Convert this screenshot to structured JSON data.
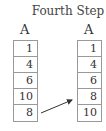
{
  "title": "Fourth Step",
  "left": {
    "label": "A",
    "values": [
      "1",
      "4",
      "6",
      "10",
      "8"
    ]
  },
  "right": {
    "label": "A",
    "values": [
      "1",
      "4",
      "6",
      "8",
      "10"
    ]
  },
  "arrow": {
    "from_row": 4,
    "to_row": 3,
    "color": "#333333"
  }
}
